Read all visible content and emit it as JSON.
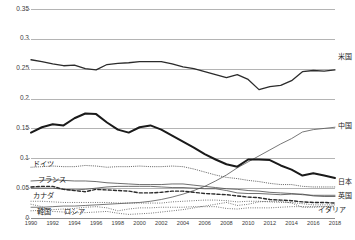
{
  "chart_data": {
    "type": "line",
    "title": "",
    "subtitle": "",
    "xlabel": "",
    "ylabel": "",
    "xlim": [
      1990,
      2018
    ],
    "ylim": [
      0,
      0.35
    ],
    "grid": true,
    "legend_position": "inline",
    "x_ticks": [
      "1990",
      "1992",
      "1994",
      "1996",
      "1998",
      "2000",
      "2002",
      "2004",
      "2006",
      "2008",
      "2010",
      "2012",
      "2014",
      "2016",
      "2018"
    ],
    "y_ticks": [
      "0",
      "0.05",
      "0.1",
      "0.15",
      "0.2",
      "0.25",
      "0.3",
      "0.35"
    ],
    "y_tick_values": [
      0,
      0.05,
      0.1,
      0.15,
      0.2,
      0.25,
      0.3,
      0.35
    ],
    "x": [
      1990,
      1991,
      1992,
      1993,
      1994,
      1995,
      1996,
      1997,
      1998,
      1999,
      2000,
      2001,
      2002,
      2003,
      2004,
      2005,
      2006,
      2007,
      2008,
      2009,
      2010,
      2011,
      2012,
      2013,
      2014,
      2015,
      2016,
      2017,
      2018
    ],
    "series": [
      {
        "name": "米国",
        "label_en": "United States",
        "style": "solid",
        "width": 1.3,
        "color": "#2b2b2b",
        "label_position": "right",
        "values": [
          0.265,
          0.262,
          0.258,
          0.255,
          0.256,
          0.25,
          0.248,
          0.257,
          0.259,
          0.26,
          0.262,
          0.262,
          0.262,
          0.258,
          0.253,
          0.25,
          0.245,
          0.24,
          0.235,
          0.24,
          0.232,
          0.215,
          0.22,
          0.222,
          0.23,
          0.245,
          0.247,
          0.246,
          0.248
        ]
      },
      {
        "name": "中国",
        "label_en": "China",
        "style": "solid",
        "width": 0.8,
        "color": "#555555",
        "label_position": "right",
        "values": [
          0.018,
          0.018,
          0.019,
          0.02,
          0.02,
          0.021,
          0.022,
          0.023,
          0.024,
          0.025,
          0.026,
          0.028,
          0.031,
          0.035,
          0.04,
          0.046,
          0.053,
          0.062,
          0.072,
          0.084,
          0.094,
          0.104,
          0.114,
          0.124,
          0.133,
          0.144,
          0.148,
          0.15,
          0.152
        ]
      },
      {
        "name": "日本",
        "label_en": "Japan",
        "style": "solid",
        "width": 2.0,
        "color": "#1a1a1a",
        "label_position": "right",
        "values": [
          0.143,
          0.152,
          0.157,
          0.155,
          0.167,
          0.175,
          0.174,
          0.16,
          0.148,
          0.143,
          0.152,
          0.155,
          0.148,
          0.138,
          0.128,
          0.118,
          0.107,
          0.098,
          0.09,
          0.086,
          0.098,
          0.098,
          0.097,
          0.088,
          0.081,
          0.071,
          0.075,
          0.071,
          0.067
        ]
      },
      {
        "name": "ドイツ",
        "label_en": "Germany",
        "style": "fine-dotted",
        "width": 0.9,
        "color": "#4a4a4a",
        "label_position": "inline-left",
        "values": [
          0.085,
          0.086,
          0.087,
          0.086,
          0.086,
          0.088,
          0.087,
          0.085,
          0.086,
          0.086,
          0.087,
          0.086,
          0.086,
          0.087,
          0.086,
          0.082,
          0.077,
          0.072,
          0.068,
          0.066,
          0.063,
          0.061,
          0.058,
          0.056,
          0.056,
          0.053,
          0.052,
          0.052,
          0.052
        ]
      },
      {
        "name": "フランス",
        "label_en": "France",
        "style": "solid",
        "width": 0.8,
        "color": "#4a4a4a",
        "label_position": "inline-left",
        "values": [
          0.062,
          0.063,
          0.064,
          0.063,
          0.062,
          0.062,
          0.061,
          0.059,
          0.058,
          0.057,
          0.056,
          0.056,
          0.056,
          0.057,
          0.057,
          0.055,
          0.053,
          0.051,
          0.049,
          0.048,
          0.046,
          0.045,
          0.043,
          0.042,
          0.041,
          0.039,
          0.038,
          0.038,
          0.038
        ]
      },
      {
        "name": "英国",
        "label_en": "United Kingdom",
        "style": "solid",
        "width": 0.8,
        "color": "#4a4a4a",
        "label_position": "right",
        "values": [
          0.05,
          0.05,
          0.05,
          0.048,
          0.047,
          0.048,
          0.05,
          0.052,
          0.053,
          0.053,
          0.053,
          0.053,
          0.052,
          0.051,
          0.051,
          0.05,
          0.049,
          0.049,
          0.046,
          0.042,
          0.041,
          0.041,
          0.04,
          0.039,
          0.04,
          0.04,
          0.037,
          0.036,
          0.036
        ]
      },
      {
        "name": "カナダ",
        "label_en": "Canada",
        "style": "dotted",
        "width": 0.9,
        "color": "#555555",
        "label_position": "inline-left",
        "values": [
          0.028,
          0.028,
          0.027,
          0.026,
          0.026,
          0.026,
          0.026,
          0.026,
          0.025,
          0.025,
          0.025,
          0.025,
          0.025,
          0.027,
          0.028,
          0.029,
          0.03,
          0.03,
          0.029,
          0.027,
          0.028,
          0.028,
          0.027,
          0.026,
          0.026,
          0.024,
          0.022,
          0.022,
          0.022
        ]
      },
      {
        "name": "イタリア",
        "label_en": "Italy",
        "style": "dashed",
        "width": 1.4,
        "color": "#2b2b2b",
        "label_position": "right",
        "values": [
          0.052,
          0.053,
          0.053,
          0.048,
          0.046,
          0.044,
          0.048,
          0.047,
          0.046,
          0.045,
          0.042,
          0.042,
          0.043,
          0.045,
          0.045,
          0.043,
          0.041,
          0.04,
          0.039,
          0.037,
          0.035,
          0.034,
          0.031,
          0.03,
          0.029,
          0.027,
          0.026,
          0.026,
          0.025
        ]
      },
      {
        "name": "韓国",
        "label_en": "South Korea",
        "style": "dotted",
        "width": 0.9,
        "color": "#555555",
        "label_position": "inline-left",
        "values": [
          0.012,
          0.013,
          0.014,
          0.015,
          0.016,
          0.018,
          0.019,
          0.017,
          0.012,
          0.015,
          0.017,
          0.017,
          0.018,
          0.018,
          0.018,
          0.019,
          0.019,
          0.019,
          0.016,
          0.015,
          0.017,
          0.017,
          0.017,
          0.018,
          0.019,
          0.019,
          0.019,
          0.019,
          0.019
        ]
      },
      {
        "name": "ロシア",
        "label_en": "Russia",
        "style": "dotted",
        "width": 0.9,
        "color": "#555555",
        "label_position": "inline-left",
        "values": [
          0.023,
          0.019,
          0.011,
          0.01,
          0.009,
          0.009,
          0.01,
          0.011,
          0.008,
          0.006,
          0.007,
          0.008,
          0.01,
          0.012,
          0.014,
          0.017,
          0.02,
          0.023,
          0.026,
          0.021,
          0.023,
          0.027,
          0.028,
          0.028,
          0.025,
          0.018,
          0.018,
          0.019,
          0.02
        ]
      }
    ]
  },
  "labels": {
    "us": "米国",
    "china": "中国",
    "japan": "日本",
    "germany": "ドイツ",
    "france": "フランス",
    "uk": "英国",
    "canada": "カナダ",
    "italy": "イタリア",
    "korea": "韓国",
    "russia": "ロシア"
  }
}
